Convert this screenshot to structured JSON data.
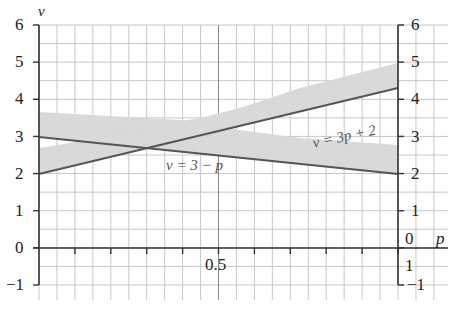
{
  "chart_data": {
    "type": "line",
    "title": "",
    "xlabel": "p",
    "ylabel": "v",
    "xlim": [
      0,
      1
    ],
    "ylim": [
      -1,
      6
    ],
    "grid": true,
    "x_tick_labels": [
      "0.5"
    ],
    "y_tick_labels_left": [
      "6",
      "5",
      "4",
      "3",
      "2",
      "1",
      "0",
      "−1"
    ],
    "y_tick_labels_right": [
      "6",
      "5",
      "4",
      "3",
      "2",
      "1",
      "0",
      "1",
      "−1"
    ],
    "series": [
      {
        "name": "v = 3p + 2",
        "x": [
          0,
          1
        ],
        "values": [
          2,
          4.3
        ],
        "color": "#555555"
      },
      {
        "name": "v = 3 − p",
        "x": [
          0,
          1
        ],
        "values": [
          3,
          2
        ],
        "color": "#555555"
      }
    ],
    "shaded_regions": [
      {
        "around": "v = 3p + 2",
        "description": "grey band above line",
        "left": [
          2.0,
          2.7
        ],
        "right": [
          4.3,
          4.95
        ]
      },
      {
        "around": "v = 3 − p",
        "description": "grey band above line",
        "left": [
          3.0,
          3.65
        ],
        "right": [
          2.0,
          2.8
        ]
      }
    ],
    "annotations": [
      "v = 3p + 2",
      "v = 3 − p"
    ]
  },
  "labels": {
    "y_axis": "v",
    "x_axis": "p",
    "left_ticks": [
      "6",
      "5",
      "4",
      "3",
      "2",
      "1",
      "0",
      "−1"
    ],
    "right_ticks": [
      "6",
      "5",
      "4",
      "3",
      "2",
      "1",
      "0"
    ],
    "right_extra": [
      "1",
      "−1"
    ],
    "x_tick": "0.5",
    "eq1": "v = 3p + 2",
    "eq2": "v = 3 − p"
  },
  "colors": {
    "band": "#d8d8d8",
    "line": "#555555",
    "grid": "#c4c4c4",
    "axis": "#333333"
  }
}
